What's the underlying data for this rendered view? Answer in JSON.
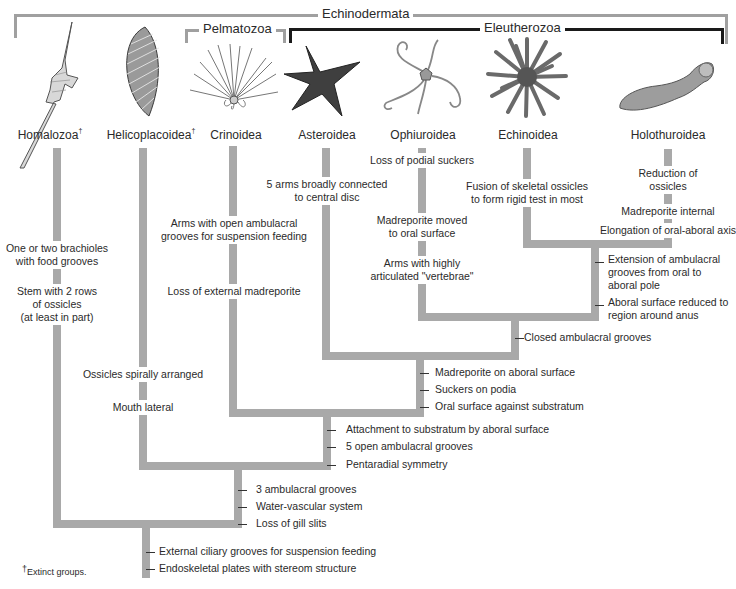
{
  "groups": {
    "echinodermata": "Echinodermata",
    "pelmatozoa": "Pelmatozoa",
    "eleutherozoa": "Eleutherozoa"
  },
  "taxa": [
    {
      "name": "Homalozoa",
      "extinct": true,
      "icon": "homalozoan-fossil-icon"
    },
    {
      "name": "Helicoplacoidea",
      "extinct": true,
      "icon": "helicoplacoid-fossil-icon"
    },
    {
      "name": "Crinoidea",
      "extinct": false,
      "icon": "crinoid-icon"
    },
    {
      "name": "Asteroidea",
      "extinct": false,
      "icon": "sea-star-icon"
    },
    {
      "name": "Ophiuroidea",
      "extinct": false,
      "icon": "brittle-star-icon"
    },
    {
      "name": "Echinoidea",
      "extinct": false,
      "icon": "sea-urchin-icon"
    },
    {
      "name": "Holothuroidea",
      "extinct": false,
      "icon": "sea-cucumber-icon"
    }
  ],
  "dagger": "†",
  "branch_traits": {
    "homalozoa": [
      "One or two brachioles\nwith food grooves",
      "Stem with 2 rows\nof ossicles\n(at least in part)"
    ],
    "helicoplacoidea": [
      "Ossicles spirally arranged",
      "Mouth lateral"
    ],
    "crinoidea": [
      "Arms with open ambulacral\ngrooves for suspension feeding",
      "Loss of external madreporite"
    ],
    "asteroidea": [
      "5 arms broadly connected\nto central disc"
    ],
    "ophiuroidea": [
      "Loss of podial suckers",
      "Madreporite moved\nto oral surface",
      "Arms with highly\narticulated \"vertebrae\""
    ],
    "echinoidea": [
      "Fusion of skeletal ossicles\nto form rigid test in most"
    ],
    "holothuroidea": [
      "Reduction of\nossicles",
      "Madreporite internal",
      "Elongation of oral-aboral axis"
    ]
  },
  "node_traits": {
    "echinozoa": [
      "Extension of ambulacral\ngrooves from oral to\naboral pole",
      "Aboral surface reduced to\nregion around anus"
    ],
    "ophiuroid_echinozoa": [
      "Closed ambulacral grooves"
    ],
    "eleutherozoa": [
      "Madreporite on aboral surface",
      "Suckers on podia",
      "Oral surface against substratum"
    ],
    "pentaradiata": [
      "Attachment to substratum by aboral surface",
      "5 open ambulacral grooves",
      "Pentaradial symmetry"
    ],
    "helico_plus": [
      "3 ambulacral grooves",
      "Water-vascular system",
      "Loss of gill slits"
    ],
    "echinodermata": [
      "External ciliary grooves for suspension feeding",
      "Endoskeletal plates with stereom structure"
    ]
  },
  "footnote": "Extinct groups.",
  "colors": {
    "branch": "#a9a9a9",
    "echinodermata_bracket": "#a0a0a0",
    "eleutherozoa_bracket": "#1a1a1a",
    "text": "#2a2a2a"
  }
}
